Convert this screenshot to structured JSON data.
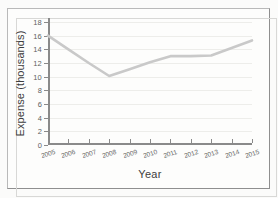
{
  "chart_data": {
    "type": "line",
    "title": "",
    "xlabel": "Year",
    "ylabel": "Expense (thousands)",
    "x": [
      2005,
      2006,
      2007,
      2008,
      2009,
      2010,
      2011,
      2012,
      2013,
      2014,
      2015
    ],
    "xtick_labels": [
      "2005",
      "2006",
      "2007",
      "2008",
      "2009",
      "2010",
      "2011",
      "2012",
      "2013",
      "2014",
      "2015"
    ],
    "values": [
      16.0,
      14.0,
      12.0,
      10.1,
      11.1,
      12.1,
      13.0,
      13.0,
      13.1,
      14.2,
      15.3
    ],
    "series": [
      {
        "name": "Expense",
        "values": [
          16.0,
          14.0,
          12.0,
          10.1,
          11.1,
          12.1,
          13.0,
          13.0,
          13.1,
          14.2,
          15.3
        ]
      }
    ],
    "ytick_labels": [
      "0",
      "2",
      "4",
      "6",
      "8",
      "10",
      "12",
      "14",
      "16",
      "18"
    ],
    "yticks": [
      0,
      2,
      4,
      6,
      8,
      10,
      12,
      14,
      16,
      18
    ],
    "ylim": [
      0,
      18
    ],
    "xlim": [
      2005,
      2015
    ],
    "grid": true,
    "legend": false,
    "line_color": "#c9c9c9",
    "axis_color": "#8a8a8a",
    "grid_color": "#ededea",
    "text_color": "#3e3e3e",
    "background_color": "#fdfdfc"
  }
}
